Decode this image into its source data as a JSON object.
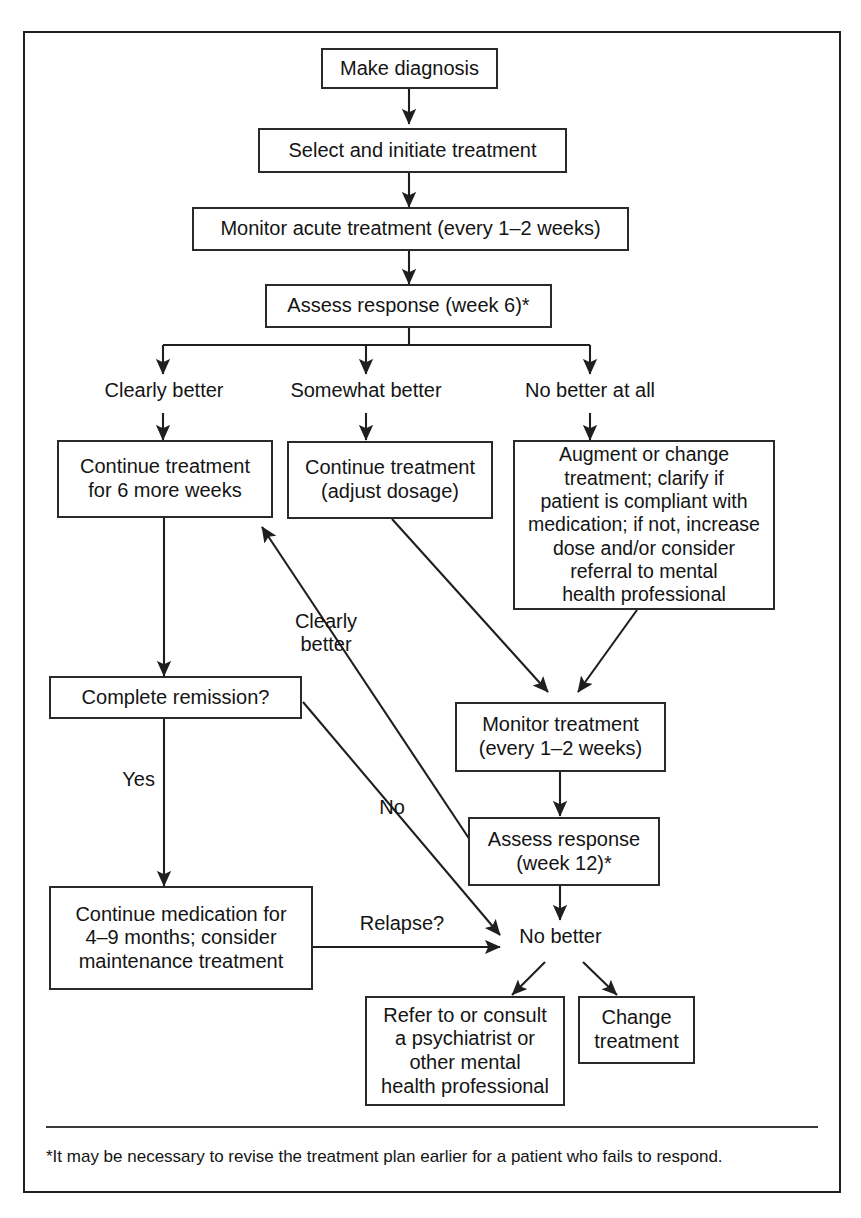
{
  "figure": {
    "type": "flowchart",
    "footnote": "*It may be necessary to revise the treatment plan earlier for a patient who fails to respond.",
    "colors": {
      "border": "#2a2a2a",
      "text": "#141414",
      "background": "#ffffff",
      "frame": "#1f1f1f"
    }
  },
  "nodes": {
    "make_diagnosis": "Make diagnosis",
    "select_initiate": "Select and initiate treatment",
    "monitor_acute": "Monitor acute treatment (every 1–2 weeks)",
    "assess_week6": "Assess response (week 6)*",
    "continue_6_weeks": "Continue treatment\nfor 6 more weeks",
    "continue_adjust": "Continue treatment\n(adjust dosage)",
    "augment_change": "Augment or change\ntreatment; clarify if\npatient is compliant with\nmedication; if not, increase\ndose and/or consider\nreferral to mental\nhealth professional",
    "complete_remission": "Complete remission?",
    "monitor_treatment": "Monitor treatment\n(every 1–2 weeks)",
    "assess_week12": "Assess response\n(week 12)*",
    "continue_medication": "Continue medication for\n4–9 months; consider\nmaintenance treatment",
    "refer_consult": "Refer to or consult\na psychiatrist or\nother mental\nhealth professional",
    "change_treatment": "Change\ntreatment"
  },
  "branch_labels": {
    "clearly_better": "Clearly better",
    "somewhat_better": "Somewhat better",
    "no_better_at_all": "No better at all"
  },
  "edge_labels": {
    "clearly_better_return": "Clearly\nbetter",
    "yes": "Yes",
    "no": "No",
    "relapse": "Relapse?",
    "no_better": "No better"
  }
}
